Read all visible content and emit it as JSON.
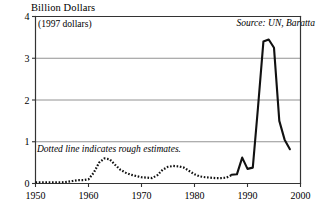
{
  "chart_data": {
    "type": "line",
    "title": "Billion Dollars",
    "subtitle": "(1997 dollars)",
    "xlabel": "",
    "ylabel": "Billion Dollars",
    "units_note": "(1997 dollars)",
    "source": "Source: UN, Baratta",
    "estimate_note": "Dotted line indicates rough estimates.",
    "grid": true,
    "legend_position": "none",
    "xlim": [
      1950,
      2000
    ],
    "ylim": [
      0,
      4
    ],
    "yticks": [
      0,
      1,
      2,
      3,
      4
    ],
    "ytick_labels": [
      "0",
      "1",
      "2",
      "3",
      "4"
    ],
    "xticks": [
      1950,
      1960,
      1970,
      1980,
      1990,
      2000
    ],
    "xtick_labels": [
      "1950",
      "1960",
      "1970",
      "1980",
      "1990",
      "2000"
    ],
    "series": [
      {
        "name": "UN peacekeeping spending (rough estimates)",
        "style": "dotted",
        "x": [
          1950,
          1951,
          1952,
          1953,
          1954,
          1955,
          1956,
          1957,
          1958,
          1959,
          1960,
          1961,
          1962,
          1963,
          1964,
          1965,
          1966,
          1967,
          1968,
          1969,
          1970,
          1971,
          1972,
          1973,
          1974,
          1975,
          1976,
          1977,
          1978,
          1979,
          1980,
          1981,
          1982,
          1983,
          1984,
          1985,
          1986,
          1987
        ],
        "values": [
          0.03,
          0.03,
          0.03,
          0.03,
          0.03,
          0.03,
          0.04,
          0.06,
          0.08,
          0.08,
          0.1,
          0.26,
          0.5,
          0.6,
          0.58,
          0.45,
          0.33,
          0.26,
          0.21,
          0.18,
          0.15,
          0.14,
          0.13,
          0.2,
          0.33,
          0.4,
          0.42,
          0.41,
          0.38,
          0.3,
          0.22,
          0.17,
          0.15,
          0.14,
          0.13,
          0.13,
          0.14,
          0.2
        ]
      },
      {
        "name": "UN peacekeeping spending (reported)",
        "style": "solid",
        "x": [
          1987,
          1988,
          1989,
          1990,
          1991,
          1992,
          1993,
          1994,
          1995,
          1996,
          1997,
          1998
        ],
        "values": [
          0.21,
          0.22,
          0.62,
          0.35,
          0.38,
          1.85,
          3.4,
          3.45,
          3.25,
          1.5,
          1.05,
          0.82
        ]
      }
    ],
    "annotations": [
      {
        "text": "Source: UN, Baratta",
        "x": 1995.5,
        "y": 3.86,
        "style": "italic"
      },
      {
        "text": "Dotted line indicates rough estimates.",
        "x": 1951,
        "y": 0.92,
        "style": "italic"
      },
      {
        "text": "(1997 dollars)",
        "x": 1950.5,
        "y": 3.78,
        "style": "normal"
      }
    ]
  },
  "colors": {
    "line": "#111111",
    "frame": "#333333",
    "grid": "#777777",
    "background": "#ffffff",
    "text": "#000000"
  }
}
